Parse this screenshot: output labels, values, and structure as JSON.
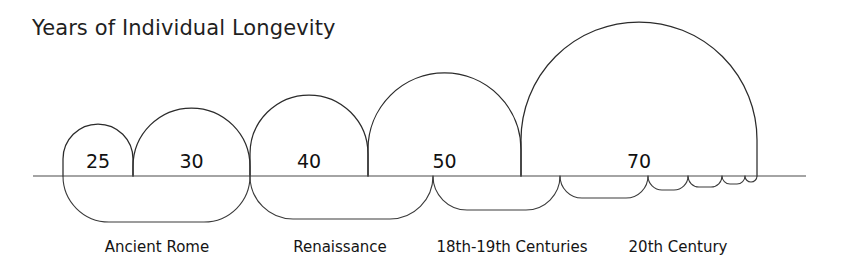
{
  "chart_data": {
    "type": "bar",
    "title": "Years of Individual Longevity",
    "xlabel": "",
    "ylabel": "",
    "grid": false,
    "legend": "none",
    "axis_baseline_label": "",
    "categories": [
      "25",
      "30",
      "40",
      "50",
      "70"
    ],
    "values": [
      25,
      30,
      40,
      50,
      70
    ],
    "value_labels": [
      "25",
      "30",
      "40",
      "50",
      "70"
    ],
    "ylim": [
      0,
      70
    ],
    "bars": [
      {
        "label": "25",
        "value": 25,
        "x_start": 63,
        "x_end": 133,
        "top_y": 124
      },
      {
        "label": "30",
        "value": 30,
        "x_start": 133,
        "x_end": 250,
        "top_y": 108
      },
      {
        "label": "40",
        "value": 40,
        "x_start": 250,
        "x_end": 368,
        "top_y": 95
      },
      {
        "label": "50",
        "value": 50,
        "x_start": 368,
        "x_end": 521,
        "top_y": 73
      },
      {
        "label": "70",
        "value": 70,
        "x_start": 521,
        "x_end": 757,
        "top_y": 22
      }
    ],
    "group_labels": [
      "Ancient Rome",
      "Renaissance",
      "18th-19th Centuries",
      "20th Century"
    ],
    "groups": [
      {
        "label": "Ancient Rome",
        "x_start": 63,
        "x_end": 250,
        "depth": 46,
        "label_x": 157
      },
      {
        "label": "Renaissance",
        "x_start": 250,
        "x_end": 433,
        "depth": 42,
        "label_x": 340
      },
      {
        "label": "18th-19th Centuries",
        "x_start": 433,
        "x_end": 648,
        "depth": 34,
        "label_x": 512
      },
      {
        "label": "20th Century",
        "x_start": 648,
        "x_end": 757,
        "depth": 18,
        "label_x": 678
      }
    ],
    "lower_arcs": [
      {
        "x_start": 63,
        "x_end": 250,
        "depth": 46
      },
      {
        "x_start": 250,
        "x_end": 433,
        "depth": 43
      },
      {
        "x_start": 433,
        "x_end": 560,
        "depth": 34
      },
      {
        "x_start": 560,
        "x_end": 648,
        "depth": 22
      },
      {
        "x_start": 648,
        "x_end": 688,
        "depth": 14
      },
      {
        "x_start": 688,
        "x_end": 722,
        "depth": 11
      },
      {
        "x_start": 722,
        "x_end": 745,
        "depth": 8
      },
      {
        "x_start": 745,
        "x_end": 757,
        "depth": 6
      }
    ],
    "baseline": {
      "y": 176,
      "x_start": 33,
      "x_end": 806
    },
    "colors": {
      "background": "#ffffff",
      "stroke": "#2b2b2b",
      "text": "#1a1a1a",
      "baseline": "#4a4a4a"
    }
  },
  "labels": {
    "title": "Years of Individual Longevity",
    "group_label_y": 252,
    "value_label_y": 168
  }
}
